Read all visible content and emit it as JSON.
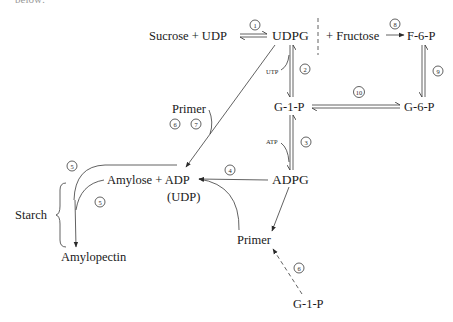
{
  "caption_fragment": "below:",
  "nodes": {
    "sucrose_udp": "Sucrose + UDP",
    "udpg": "UDPG",
    "fructose": "+ Fructose",
    "f6p": "F-6-P",
    "g1p": "G-1-P",
    "g6p": "G-6-P",
    "adpg": "ADPG",
    "primer_top": "Primer",
    "amylose_adp": "Amylose + ADP",
    "udp_paren": "(UDP)",
    "starch": "Starch",
    "amylopectin": "Amylopectin",
    "primer_bottom": "Primer",
    "g1p_bottom": "G-1-P"
  },
  "cofactors": {
    "utp": "UTP",
    "atp": "ATP"
  },
  "steps": {
    "s1": "1",
    "s2": "2",
    "s3": "3",
    "s4": "4",
    "s5a": "5",
    "s5b": "5",
    "s6a": "6",
    "s7": "7",
    "s6b": "6",
    "s8": "8",
    "s9": "9",
    "s10": "10"
  },
  "edges": [
    {
      "from": "Sucrose + UDP",
      "to": "UDPG",
      "step": "1",
      "type": "reversible"
    },
    {
      "from": "UDPG",
      "to": "G-1-P",
      "step": "2",
      "type": "reversible",
      "cofactor": "UTP"
    },
    {
      "from": "G-1-P",
      "to": "ADPG",
      "step": "3",
      "type": "reversible",
      "cofactor": "ATP"
    },
    {
      "from": "ADPG",
      "to": "Amylose + ADP",
      "step": "4",
      "type": "irreversible"
    },
    {
      "from": "UDPG",
      "to": "Amylose + ADP",
      "step": "6,7",
      "type": "irreversible",
      "cofactor": "Primer"
    },
    {
      "from": "Amylose + ADP",
      "to": "Amylopectin",
      "step": "5",
      "type": "irreversible"
    },
    {
      "from": "ADPG",
      "to": "Primer",
      "type": "irreversible"
    },
    {
      "from": "Primer",
      "to": "Amylose + ADP",
      "type": "irreversible"
    },
    {
      "from": "G-1-P",
      "to": "Primer",
      "step": "6",
      "type": "dashed"
    },
    {
      "from": "Fructose",
      "to": "F-6-P",
      "step": "8",
      "type": "irreversible"
    },
    {
      "from": "F-6-P",
      "to": "G-6-P",
      "step": "9",
      "type": "reversible"
    },
    {
      "from": "G-6-P",
      "to": "G-1-P",
      "step": "10",
      "type": "reversible"
    }
  ]
}
